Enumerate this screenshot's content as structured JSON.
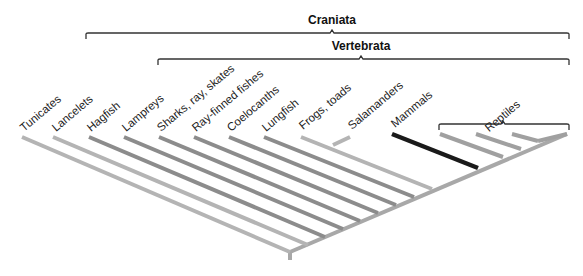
{
  "diagram": {
    "type": "cladogram",
    "clades": [
      {
        "label": "Craniata",
        "bracket": {
          "x1": 86,
          "x2": 569,
          "y": 33,
          "tick_x": 332
        }
      },
      {
        "label": "Vertebrata",
        "bracket": {
          "x1": 158,
          "x2": 569,
          "y": 59,
          "tick_x": 361
        }
      },
      {
        "label": "Reptiles",
        "bracket": {
          "x1": 439,
          "x2": 569,
          "y": 124,
          "tick_x": 503
        }
      }
    ],
    "taxa": [
      {
        "name": "Tunicates",
        "tip_x": 22,
        "tip_y": 137,
        "node_x": 290,
        "node_y": 252,
        "color": "#b4b4b4"
      },
      {
        "name": "Lancelets",
        "tip_x": 53,
        "tip_y": 137,
        "node_x": 308,
        "node_y": 245,
        "color": "#b4b4b4"
      },
      {
        "name": "Hagfish",
        "tip_x": 89,
        "tip_y": 137,
        "node_x": 325,
        "node_y": 237,
        "color": "#8c8c8c"
      },
      {
        "name": "Lampreys",
        "tip_x": 124,
        "tip_y": 137,
        "node_x": 343,
        "node_y": 229,
        "color": "#8c8c8c"
      },
      {
        "name": "Sharks, ray, skates",
        "tip_x": 159,
        "tip_y": 137,
        "node_x": 360,
        "node_y": 221,
        "color": "#8c8c8c"
      },
      {
        "name": "Ray-finned fishes",
        "tip_x": 194,
        "tip_y": 137,
        "node_x": 378,
        "node_y": 213,
        "color": "#8c8c8c"
      },
      {
        "name": "Coelocanths",
        "tip_x": 229,
        "tip_y": 137,
        "node_x": 396,
        "node_y": 205,
        "color": "#8c8c8c"
      },
      {
        "name": "Lungfish",
        "tip_x": 264,
        "tip_y": 137,
        "node_x": 414,
        "node_y": 197,
        "color": "#8c8c8c"
      },
      {
        "name": "Frogs, toads",
        "tip_x": 301,
        "tip_y": 137,
        "node_x": 432,
        "node_y": 189,
        "color": "#b4b4b4"
      },
      {
        "name": "Salamanders",
        "tip_x": 350,
        "tip_y": 137,
        "node_x": 333,
        "node_y": 145,
        "color": "#b4b4b4"
      },
      {
        "name": "Mammals",
        "tip_x": 392,
        "tip_y": 134,
        "node_x": 478,
        "node_y": 168,
        "color": "#1a1a1a"
      },
      {
        "name": "Reptile-1",
        "tip_x": 440,
        "tip_y": 134,
        "node_x": 503,
        "node_y": 157,
        "color": "#a0a0a0",
        "label_hidden": true
      },
      {
        "name": "Reptile-2",
        "tip_x": 476,
        "tip_y": 134,
        "node_x": 521,
        "node_y": 149,
        "color": "#a0a0a0",
        "label_hidden": true
      },
      {
        "name": "Reptile-3",
        "tip_x": 512,
        "tip_y": 134,
        "node_x": 538,
        "node_y": 141,
        "color": "#a0a0a0",
        "label_hidden": true
      },
      {
        "name": "Reptile-4",
        "tip_x": 567,
        "tip_y": 134,
        "node_x": 538,
        "node_y": 141,
        "color": "#a0a0a0",
        "label_hidden": true
      }
    ],
    "labels": [
      {
        "text": "Tunicates",
        "x": 24,
        "y": 132
      },
      {
        "text": "Lancelets",
        "x": 56,
        "y": 132
      },
      {
        "text": "Hagfish",
        "x": 91,
        "y": 132
      },
      {
        "text": "Lampreys",
        "x": 126,
        "y": 132
      },
      {
        "text": "Sharks, ray, skates",
        "x": 161,
        "y": 132
      },
      {
        "text": "Ray-finned fishes",
        "x": 196,
        "y": 132
      },
      {
        "text": "Coelocanths",
        "x": 231,
        "y": 132
      },
      {
        "text": "Lungfish",
        "x": 266,
        "y": 132
      },
      {
        "text": "Frogs, toads",
        "x": 303,
        "y": 130
      },
      {
        "text": "Salamanders",
        "x": 352,
        "y": 130
      },
      {
        "text": "Mammals",
        "x": 395,
        "y": 128
      },
      {
        "text": "Reptiles",
        "x": 505,
        "y": 119
      }
    ],
    "spine": {
      "x1": 290,
      "y1": 252,
      "x2": 567,
      "y2": 134,
      "color": "#a8a8a8"
    },
    "root": {
      "x": 290,
      "y1": 252,
      "y2": 260,
      "color": "#a8a8a8"
    }
  }
}
